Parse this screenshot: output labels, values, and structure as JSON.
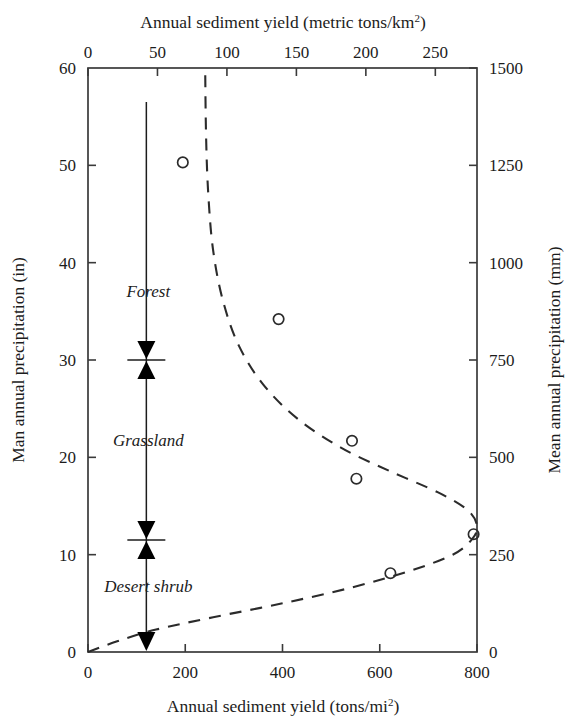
{
  "chart_data": {
    "type": "scatter",
    "title": "",
    "xlabel": "Annual sediment yield (tons/mi²)",
    "ylabel": "Man annual precipitation (in)",
    "x2label": "Annual sediment yield (metric tons/km²)",
    "y2label": "Mean annual precipitation (mm)",
    "xlim": [
      0,
      800
    ],
    "ylim": [
      0,
      60
    ],
    "x2lim": [
      0,
      280
    ],
    "y2lim": [
      0,
      1500
    ],
    "xticks": [
      0,
      200,
      400,
      600,
      800
    ],
    "xtick_labels": [
      "0",
      "200",
      "400",
      "600",
      "800"
    ],
    "yticks": [
      0,
      10,
      20,
      30,
      40,
      50,
      60
    ],
    "ytick_labels": [
      "0",
      "10",
      "20",
      "30",
      "40",
      "50",
      "60"
    ],
    "x2ticks": [
      0,
      50,
      100,
      150,
      200,
      250
    ],
    "x2tick_labels": [
      "0",
      "50",
      "100",
      "150",
      "200",
      "250"
    ],
    "y2ticks": [
      0,
      250,
      500,
      750,
      1000,
      1250,
      1500
    ],
    "y2tick_labels": [
      "0",
      "250",
      "500",
      "750",
      "1000",
      "1250",
      "1500"
    ],
    "grid": false,
    "legend": false,
    "points": [
      {
        "x": 195,
        "y": 50.3
      },
      {
        "x": 392,
        "y": 34.2
      },
      {
        "x": 543,
        "y": 21.7
      },
      {
        "x": 552,
        "y": 17.8
      },
      {
        "x": 793,
        "y": 12.1
      },
      {
        "x": 622,
        "y": 8.1
      }
    ],
    "curve": {
      "name": "fitted sediment yield curve",
      "style": "dashed",
      "points": [
        {
          "x": 0,
          "y": 0.0
        },
        {
          "x": 60,
          "y": 1.1
        },
        {
          "x": 140,
          "y": 2.3
        },
        {
          "x": 260,
          "y": 3.6
        },
        {
          "x": 400,
          "y": 5.0
        },
        {
          "x": 540,
          "y": 6.6
        },
        {
          "x": 660,
          "y": 8.3
        },
        {
          "x": 750,
          "y": 10.0
        },
        {
          "x": 790,
          "y": 11.6
        },
        {
          "x": 800,
          "y": 13.0
        },
        {
          "x": 780,
          "y": 14.6
        },
        {
          "x": 720,
          "y": 16.4
        },
        {
          "x": 620,
          "y": 18.6
        },
        {
          "x": 520,
          "y": 21.0
        },
        {
          "x": 430,
          "y": 24.0
        },
        {
          "x": 360,
          "y": 27.5
        },
        {
          "x": 310,
          "y": 31.5
        },
        {
          "x": 278,
          "y": 36.0
        },
        {
          "x": 258,
          "y": 41.0
        },
        {
          "x": 248,
          "y": 46.5
        },
        {
          "x": 243,
          "y": 52.5
        },
        {
          "x": 241,
          "y": 60.0
        }
      ]
    },
    "annotations": [
      {
        "label": "Forest",
        "y_top": 60,
        "y_bottom": 30
      },
      {
        "label": "Grassland",
        "y_top": 30,
        "y_bottom": 11.5
      },
      {
        "label": "Desert shrub",
        "y_top": 11.5,
        "y_bottom": 0
      }
    ],
    "bracket": {
      "x_value": 120,
      "dividers": [
        30,
        11.5
      ],
      "top": 60,
      "bottom": 0
    }
  },
  "superscripts": {
    "km2": "2",
    "mi2": "2"
  },
  "axis_title_parts": {
    "x_main": "Annual sediment yield (tons/mi",
    "x_tail": ")",
    "x2_main": "Annual sediment yield (metric tons/km",
    "x2_tail": ")"
  }
}
